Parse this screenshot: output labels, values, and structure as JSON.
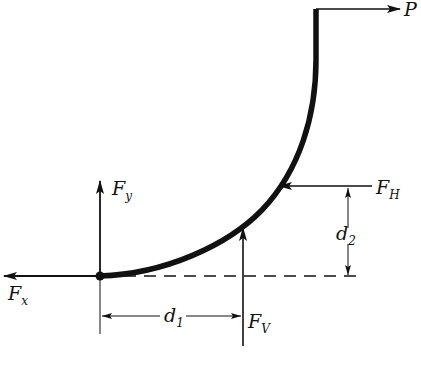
{
  "diagram": {
    "colors": {
      "stroke": "#111111",
      "background": "#ffffff"
    },
    "labels": {
      "P": {
        "main": "P",
        "sub": ""
      },
      "Fy": {
        "main": "F",
        "sub": "y"
      },
      "Fx": {
        "main": "F",
        "sub": "x"
      },
      "FH": {
        "main": "F",
        "sub": "H"
      },
      "FV": {
        "main": "F",
        "sub": "V"
      },
      "d1": {
        "main": "d",
        "sub": "1"
      },
      "d2": {
        "main": "d",
        "sub": "2"
      }
    },
    "elements": [
      {
        "name": "curved-member",
        "type": "thick-curve"
      },
      {
        "name": "applied-load-P",
        "direction": "right"
      },
      {
        "name": "reaction-Fx",
        "direction": "left"
      },
      {
        "name": "reaction-Fy",
        "direction": "up"
      },
      {
        "name": "force-FH",
        "direction": "left"
      },
      {
        "name": "force-FV",
        "direction": "up"
      },
      {
        "name": "dimension-d1",
        "orientation": "horizontal"
      },
      {
        "name": "dimension-d2",
        "orientation": "vertical"
      },
      {
        "name": "reference-line",
        "style": "dashed"
      },
      {
        "name": "pin-support",
        "type": "dot"
      }
    ]
  }
}
